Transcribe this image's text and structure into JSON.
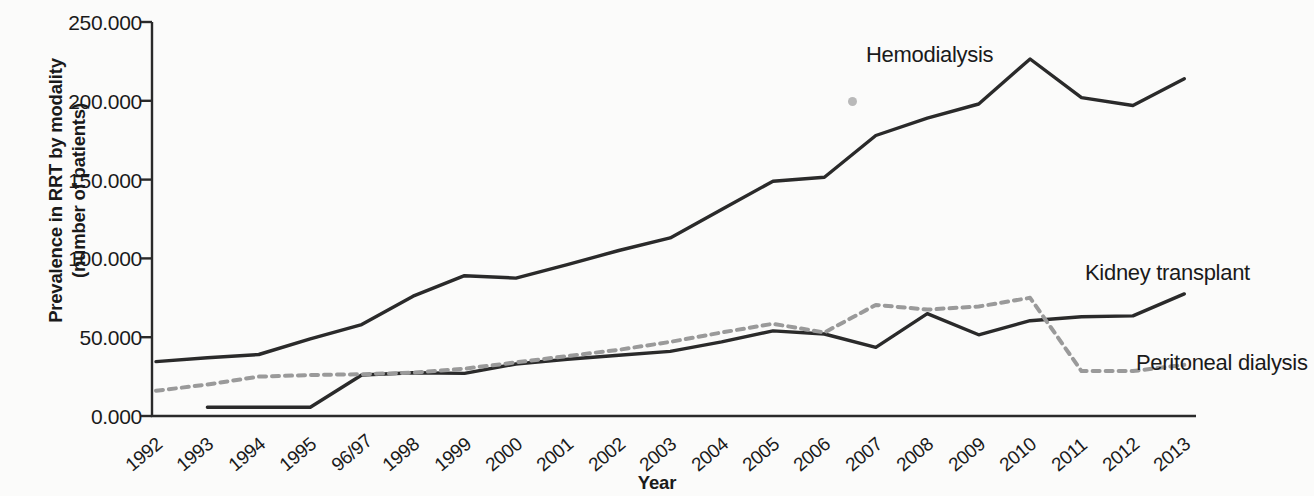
{
  "axes": {
    "ylabel_line1": "Prevalence in RRT by modality",
    "ylabel_line2": "(number of patients)",
    "xlabel": "Year",
    "ytick_labels": [
      "250.000",
      "200.000",
      "150.000",
      "100.000",
      "50.000",
      "0.000"
    ]
  },
  "labels": {
    "hemodialysis": "Hemodialysis",
    "kidney_transplant": "Kidney transplant",
    "peritoneal_dialysis": "Peritoneal dialysis"
  },
  "chart_data": {
    "type": "line",
    "title": "",
    "xlabel": "Year",
    "ylabel": "Prevalence in RRT by modality (number of patients)",
    "ylim": [
      0,
      250000
    ],
    "ytick_values": [
      250000,
      200000,
      150000,
      100000,
      50000,
      0
    ],
    "ytick_labels": [
      "250.000",
      "200.000",
      "150.000",
      "100.000",
      "50.000",
      "0.000"
    ],
    "grid": false,
    "legend_position": "inline-annotations",
    "categories": [
      "1992",
      "1993",
      "1994",
      "1995",
      "96/97",
      "1998",
      "1999",
      "2000",
      "2001",
      "2002",
      "2003",
      "2004",
      "2005",
      "2006",
      "2007",
      "2008",
      "2009",
      "2010",
      "2011",
      "2012",
      "2013"
    ],
    "series": [
      {
        "name": "Hemodialysis",
        "style": "solid",
        "color": "#2a2a2a",
        "values": [
          34500,
          37000,
          39000,
          49000,
          58000,
          76000,
          89000,
          87500,
          96000,
          105000,
          113000,
          131000,
          149000,
          151500,
          178000,
          189000,
          198000,
          226500,
          202000,
          197000,
          214000
        ]
      },
      {
        "name": "Kidney transplant",
        "style": "solid",
        "color": "#2a2a2a",
        "values": [
          null,
          5500,
          5500,
          5500,
          26000,
          27500,
          27000,
          33000,
          36000,
          38500,
          41000,
          47000,
          54000,
          52000,
          43500,
          65000,
          51500,
          60500,
          63000,
          63500,
          77500
        ]
      },
      {
        "name": "Peritoneal dialysis",
        "style": "dashed",
        "color": "#9a9a9a",
        "values": [
          16000,
          20000,
          25000,
          26000,
          26500,
          27500,
          30000,
          34000,
          38000,
          42000,
          47000,
          53000,
          58500,
          53000,
          70500,
          67500,
          69500,
          75000,
          28500,
          28500,
          32500
        ]
      }
    ]
  }
}
